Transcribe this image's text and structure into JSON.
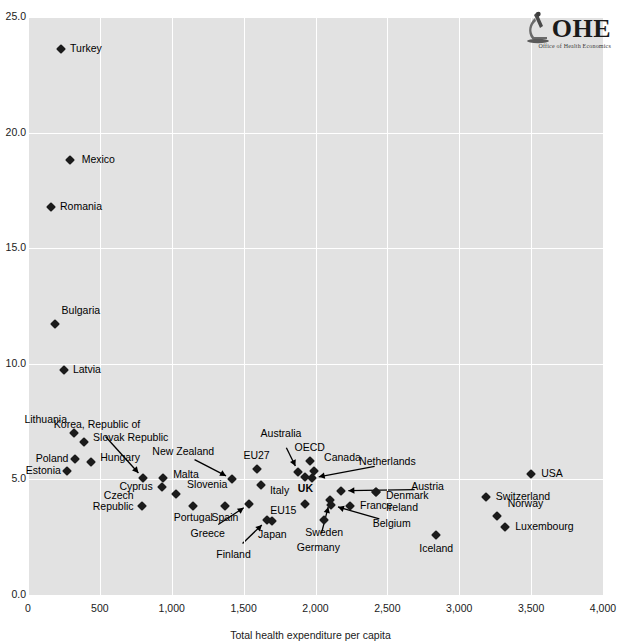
{
  "logo": {
    "name": "OHE",
    "subtitle": "Office of Health Economics",
    "mark": "microscope-icon"
  },
  "chart_data": {
    "type": "scatter",
    "title": "",
    "xlabel": "Total health expenditure per capita",
    "ylabel": "",
    "xlim": [
      0,
      4000
    ],
    "ylim": [
      0.0,
      25.0
    ],
    "xticks": [
      "0",
      "500",
      "1,000",
      "1,500",
      "2,000",
      "2,500",
      "3,000",
      "3,500",
      "4,000"
    ],
    "yticks": [
      "0.0",
      "5.0",
      "10.0",
      "15.0",
      "20.0",
      "25.0"
    ],
    "grid": true,
    "legend": "none",
    "marker": "diamond",
    "marker_color": "#1b1b1b",
    "panel_color": "#e2e2e2",
    "points": [
      {
        "label": "Turkey",
        "x": 230,
        "y": 23.6,
        "lx": 9,
        "ly": 0,
        "align": "r"
      },
      {
        "label": "Mexico",
        "x": 290,
        "y": 18.8,
        "lx": 12,
        "ly": 0,
        "align": "r"
      },
      {
        "label": "Romania",
        "x": 160,
        "y": 16.8,
        "lx": 9,
        "ly": 0,
        "align": "r"
      },
      {
        "label": "Bulgaria",
        "x": 185,
        "y": 11.7,
        "lx": 7,
        "ly": -13,
        "align": "r"
      },
      {
        "label": "Latvia",
        "x": 250,
        "y": 9.75,
        "lx": 9,
        "ly": 0,
        "align": "r"
      },
      {
        "label": "Lithuania",
        "x": 320,
        "y": 7.0,
        "lx": -7,
        "ly": -13,
        "align": "l"
      },
      {
        "label": "Slovak  Republic",
        "x": 390,
        "y": 6.6,
        "lx": 9,
        "ly": -4,
        "align": "r"
      },
      {
        "label": "Poland",
        "x": 330,
        "y": 5.9,
        "lx": -7,
        "ly": 0,
        "align": "l"
      },
      {
        "label": "Hungary",
        "x": 440,
        "y": 5.75,
        "lx": 9,
        "ly": -4,
        "align": "r"
      },
      {
        "label": "Estonia",
        "x": 270,
        "y": 5.35,
        "lx": -6,
        "ly": 0,
        "align": "l"
      },
      {
        "label": "Korea, Republic of",
        "x": 800,
        "y": 5.05,
        "lx": 0,
        "ly": 0,
        "align": "leader",
        "tx": 480,
        "ty": 7.35,
        "t_align": "c"
      },
      {
        "label": "Malta",
        "x": 940,
        "y": 5.05,
        "lx": 10,
        "ly": -3,
        "align": "r"
      },
      {
        "label": "Cyprus",
        "x": 930,
        "y": 4.65,
        "lx": -9,
        "ly": 0,
        "align": "l"
      },
      {
        "label": "Slovenia",
        "x": 1030,
        "y": 4.35,
        "lx": 11,
        "ly": -9,
        "align": "r"
      },
      {
        "label": "Czech Republic",
        "x": 790,
        "y": 3.85,
        "lx": -8,
        "ly": 3,
        "align": "l2"
      },
      {
        "label": "Portugal",
        "x": 1150,
        "y": 3.85,
        "lx": 0,
        "ly": 12,
        "align": "c"
      },
      {
        "label": "Spain",
        "x": 1370,
        "y": 3.85,
        "lx": 0,
        "ly": 12,
        "align": "c"
      },
      {
        "label": "New Zealand",
        "x": 1420,
        "y": 5.0,
        "lx": 0,
        "ly": 0,
        "align": "leader",
        "tx": 1080,
        "ty": 6.2,
        "t_align": "c"
      },
      {
        "label": "EU27",
        "x": 1590,
        "y": 5.45,
        "lx": 0,
        "ly": -13,
        "align": "c"
      },
      {
        "label": "Italy",
        "x": 1620,
        "y": 4.75,
        "lx": 9,
        "ly": 6,
        "align": "r"
      },
      {
        "label": "Greece",
        "x": 1540,
        "y": 3.95,
        "lx": 0,
        "ly": 0,
        "align": "leader",
        "tx": 1250,
        "ty": 2.65,
        "t_align": "c"
      },
      {
        "label": "Finland",
        "x": 1660,
        "y": 3.25,
        "lx": 0,
        "ly": 0,
        "align": "leader",
        "tx": 1430,
        "ty": 1.75,
        "t_align": "c"
      },
      {
        "label": "Japan",
        "x": 1700,
        "y": 3.2,
        "lx": 0,
        "ly": 14,
        "align": "c"
      },
      {
        "label": "Australia",
        "x": 1880,
        "y": 5.3,
        "lx": 0,
        "ly": 0,
        "align": "leader",
        "tx": 1760,
        "ty": 6.95,
        "t_align": "c"
      },
      {
        "label": "OECD",
        "x": 1960,
        "y": 5.8,
        "lx": 0,
        "ly": -13,
        "align": "c"
      },
      {
        "label": "UK",
        "x": 1930,
        "y": 5.1,
        "lx": 0,
        "ly": 12,
        "align": "c",
        "bold": true
      },
      {
        "label": "Canada",
        "x": 1990,
        "y": 5.35,
        "lx": 10,
        "ly": -13,
        "align": "r"
      },
      {
        "label": "Netherlands",
        "x": 1975,
        "y": 5.05,
        "lx": 0,
        "ly": 0,
        "align": "leader",
        "tx": 2500,
        "ty": 5.75,
        "t_align": "c"
      },
      {
        "label": "EU15",
        "x": 1930,
        "y": 3.95,
        "lx": -9,
        "ly": 7,
        "align": "l"
      },
      {
        "label": "Germany",
        "x": 2100,
        "y": 4.1,
        "lx": 0,
        "ly": 0,
        "align": "leader",
        "tx": 2020,
        "ty": 2.05,
        "t_align": "c"
      },
      {
        "label": "Belgium",
        "x": 2110,
        "y": 3.9,
        "lx": 0,
        "ly": 0,
        "align": "leader",
        "tx": 2530,
        "ty": 3.05,
        "t_align": "c"
      },
      {
        "label": "Austria",
        "x": 2180,
        "y": 4.5,
        "lx": 0,
        "ly": 0,
        "align": "leader",
        "tx": 2780,
        "ty": 4.65,
        "t_align": "c"
      },
      {
        "label": "France",
        "x": 2240,
        "y": 3.85,
        "lx": 10,
        "ly": 0,
        "align": "r"
      },
      {
        "label": "Sweden",
        "x": 2060,
        "y": 3.25,
        "lx": 0,
        "ly": 13,
        "align": "c"
      },
      {
        "label": "Denmark",
        "x": 2420,
        "y": 4.45,
        "lx": 10,
        "ly": 4,
        "align": "r"
      },
      {
        "label": "Ireland",
        "x": 2420,
        "y": 4.45,
        "lx": 10,
        "ly": 16,
        "align": "r"
      },
      {
        "label": "Iceland",
        "x": 2840,
        "y": 2.6,
        "lx": 0,
        "ly": 14,
        "align": "c"
      },
      {
        "label": "Switzerland",
        "x": 3185,
        "y": 4.25,
        "lx": 10,
        "ly": 0,
        "align": "r"
      },
      {
        "label": "Norway",
        "x": 3260,
        "y": 3.4,
        "lx": 11,
        "ly": -12,
        "align": "r"
      },
      {
        "label": "Luxembourg",
        "x": 3320,
        "y": 2.95,
        "lx": 10,
        "ly": 0,
        "align": "r"
      },
      {
        "label": "USA",
        "x": 3500,
        "y": 5.25,
        "lx": 10,
        "ly": 0,
        "align": "r"
      }
    ]
  }
}
